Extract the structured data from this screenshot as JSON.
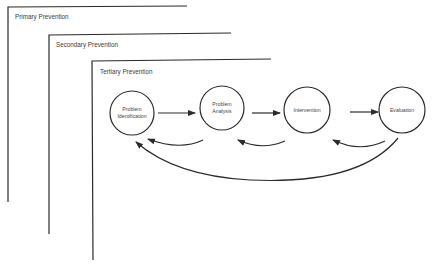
{
  "diagram": {
    "levels": [
      {
        "label": "Primary Prevention"
      },
      {
        "label": "Secondary Prevention"
      },
      {
        "label": "Tertiary Prevention"
      }
    ],
    "nodes": [
      {
        "line1": "Problem",
        "line2": "Identification"
      },
      {
        "line1": "Problem",
        "line2": "Analysis"
      },
      {
        "line1": "Intervention",
        "line2": ""
      },
      {
        "line1": "Evaluation",
        "line2": ""
      }
    ],
    "colors": {
      "stroke": "#2b2b2b",
      "background": "#ffffff"
    }
  }
}
